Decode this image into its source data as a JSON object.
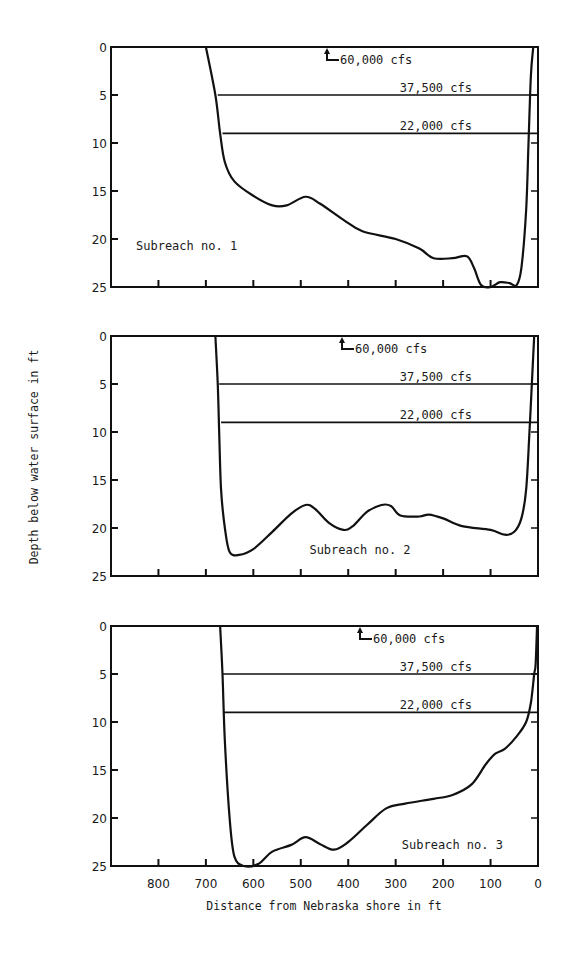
{
  "chart_data": {
    "type": "line",
    "title": "",
    "xlabel": "Distance from Nebraska shore in ft",
    "ylabel": "Depth below water surface in ft",
    "xlim": [
      900,
      0
    ],
    "ylim": [
      0,
      25
    ],
    "x_ticks": [
      800,
      700,
      600,
      500,
      400,
      300,
      200,
      100,
      0
    ],
    "x_minor_ticks": [
      800,
      700,
      600,
      500,
      400,
      300,
      200,
      100
    ],
    "y_ticks": [
      0,
      5,
      10,
      15,
      20,
      25
    ],
    "grid": false,
    "panels": [
      {
        "label": "Subreach no. 1",
        "label_position": "bottom-left",
        "flow_levels": [
          {
            "name": "60,000 cfs",
            "depth": 0,
            "marker": "arrow-to-surface"
          },
          {
            "name": "37,500 cfs",
            "depth": 5,
            "left_extent": 675
          },
          {
            "name": "22,000 cfs",
            "depth": 9,
            "left_extent": 665
          }
        ],
        "profile": {
          "x": [
            700,
            680,
            670,
            660,
            640,
            600,
            560,
            530,
            490,
            460,
            410,
            370,
            300,
            250,
            220,
            180,
            150,
            135,
            120,
            100,
            80,
            60,
            45,
            35,
            25,
            20,
            15,
            10
          ],
          "y": [
            0,
            5,
            9,
            12,
            14,
            15.5,
            16.5,
            16.5,
            15.6,
            16.3,
            18,
            19.2,
            20,
            21,
            22,
            22,
            21.8,
            23,
            24.8,
            25,
            24.5,
            24.6,
            24.8,
            23,
            17,
            10,
            3,
            0
          ]
        }
      },
      {
        "label": "Subreach no. 2",
        "label_position": "bottom-center",
        "flow_levels": [
          {
            "name": "60,000 cfs",
            "depth": 0,
            "marker": "arrow-to-surface"
          },
          {
            "name": "37,500 cfs",
            "depth": 5,
            "left_extent": 672
          },
          {
            "name": "22,000 cfs",
            "depth": 9,
            "left_extent": 668
          }
        ],
        "profile": {
          "x": [
            680,
            675,
            672,
            668,
            660,
            650,
            630,
            600,
            560,
            520,
            490,
            470,
            440,
            410,
            390,
            360,
            330,
            310,
            290,
            250,
            230,
            200,
            160,
            100,
            70,
            50,
            35,
            25,
            18,
            12,
            8
          ],
          "y": [
            0,
            5,
            10,
            16,
            20,
            22.5,
            22.8,
            22.2,
            20.4,
            18.5,
            17.6,
            18,
            19.5,
            20.2,
            19.8,
            18.3,
            17.6,
            17.7,
            18.7,
            18.8,
            18.6,
            19,
            19.8,
            20.2,
            20.7,
            20.4,
            19,
            16,
            10,
            4,
            0
          ]
        }
      },
      {
        "label": "Subreach no. 3",
        "label_position": "bottom-right",
        "flow_levels": [
          {
            "name": "60,000 cfs",
            "depth": 0,
            "marker": "arrow-to-surface"
          },
          {
            "name": "37,500 cfs",
            "depth": 5,
            "left_extent": 665
          },
          {
            "name": "22,000 cfs",
            "depth": 9,
            "left_extent": 662
          }
        ],
        "profile": {
          "x": [
            670,
            665,
            660,
            650,
            640,
            620,
            590,
            560,
            520,
            490,
            460,
            430,
            400,
            360,
            320,
            280,
            220,
            180,
            140,
            110,
            90,
            70,
            45,
            25,
            15,
            8,
            5,
            2
          ],
          "y": [
            0,
            5,
            12,
            20,
            24,
            25,
            24.8,
            23.5,
            22.8,
            22,
            22.7,
            23.3,
            22.5,
            20.7,
            19,
            18.5,
            18,
            17.6,
            16.5,
            14.4,
            13.3,
            12.8,
            11.5,
            10,
            8,
            5,
            4,
            0
          ]
        }
      }
    ]
  }
}
